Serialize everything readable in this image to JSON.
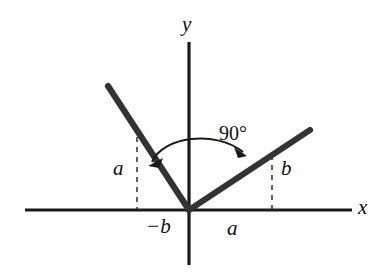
{
  "figure": {
    "background_color": "#ffffff",
    "ink_color": "#1a1a1a",
    "axes": {
      "x_label": "x",
      "y_label": "y",
      "origin": {
        "x": 189,
        "y": 210
      },
      "x_axis": {
        "x1": 25,
        "y1": 210,
        "x2": 352,
        "y2": 210
      },
      "y_axis": {
        "x1": 189,
        "y1": 42,
        "x2": 189,
        "y2": 265
      }
    },
    "rays": [
      {
        "name": "left-ray",
        "from": {
          "x": 189,
          "y": 210
        },
        "to": {
          "x": 108,
          "y": 86
        },
        "direction": "up-left",
        "rise_label": "a",
        "run_label": "-b"
      },
      {
        "name": "right-ray",
        "from": {
          "x": 189,
          "y": 210
        },
        "to": {
          "x": 310,
          "y": 130
        },
        "direction": "up-right",
        "rise_label": "b",
        "run_label": "a"
      }
    ],
    "angle": {
      "label": "90°",
      "value": 90,
      "unit": "degrees",
      "between": [
        "left-ray",
        "right-ray"
      ],
      "arrow_style": "double-headed-arc"
    },
    "dashed_guides": [
      {
        "name": "left-rise-guide",
        "x": 137,
        "y_top": 127,
        "y_bottom": 210,
        "label": "a"
      },
      {
        "name": "right-rise-guide",
        "x": 272,
        "y_top": 155,
        "y_bottom": 210,
        "label": "b"
      }
    ],
    "labels": {
      "y_axis": "y",
      "x_axis": "x",
      "angle": "90°",
      "left_rise": "a",
      "right_rise": "b",
      "left_run": "−b",
      "right_run": "a"
    }
  }
}
